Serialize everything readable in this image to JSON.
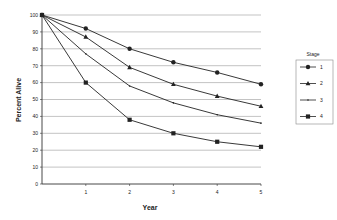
{
  "chart_data": {
    "type": "line",
    "title": "",
    "xlabel": "Year",
    "ylabel": "Percent Alive",
    "x": [
      0,
      1,
      2,
      3,
      4,
      5
    ],
    "xticks": [
      "1",
      "2",
      "3",
      "4",
      "5"
    ],
    "yticks": [
      "0",
      "10",
      "20",
      "30",
      "40",
      "50",
      "60",
      "70",
      "80",
      "90",
      "100"
    ],
    "ylim": [
      0,
      100
    ],
    "xlim": [
      0,
      5
    ],
    "grid": "horizontal",
    "legend": {
      "title": "Stage",
      "position": "right"
    },
    "series": [
      {
        "name": "1",
        "marker": "circle",
        "values": [
          100,
          92,
          80,
          72,
          66,
          59
        ]
      },
      {
        "name": "2",
        "marker": "triangle",
        "values": [
          100,
          87,
          69,
          59,
          52,
          46
        ]
      },
      {
        "name": "3",
        "marker": "dot",
        "values": [
          100,
          77,
          58,
          48,
          41,
          36
        ]
      },
      {
        "name": "4",
        "marker": "square",
        "values": [
          100,
          60,
          38,
          30,
          25,
          22
        ]
      }
    ]
  },
  "colors": {
    "line": "#222222",
    "grid": "#9a9a9a",
    "axis": "#333333",
    "legend_border": "#888888"
  }
}
